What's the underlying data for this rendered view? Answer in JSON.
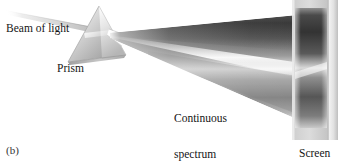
{
  "figure": {
    "panel_label": "(b)",
    "background_color": "#ffffff",
    "width": 338,
    "height": 164,
    "caption_note": "White light beam dispersed by a prism into a continuous spectrum on a screen"
  },
  "labels": {
    "beam": "Beam of light",
    "prism": "Prism",
    "spectrum_line1": "Continuous",
    "spectrum_line2": "spectrum",
    "screen": "Screen"
  },
  "elements": {
    "incoming_beam": {
      "name": "beam-of-light",
      "description": "Thin pale band entering the prism from upper left",
      "color": "#d9d9d9"
    },
    "prism": {
      "name": "prism",
      "description": "Triangular glass prism, grayscale shaded",
      "face_light_color": "#f2f2f2",
      "face_mid_color": "#c9c9c9",
      "face_dark_color": "#9a9a9a",
      "outline_color": "#8d8d8d"
    },
    "spectrum_fan": {
      "name": "continuous-spectrum",
      "description": "Wedge of dispersed light widening from prism to screen, grayscale continuous gradient with bright central streak",
      "dark_color": "#4a4a4a",
      "mid_color": "#8e8e8e",
      "bright_streak_color": "#f4f4f4"
    },
    "screen": {
      "name": "screen",
      "description": "Flat vertical panel at right receiving the spectrum",
      "face_color": "#d4d4d4",
      "edge_color": "#efefef",
      "band_dark_color": "#3d3d3d"
    }
  }
}
